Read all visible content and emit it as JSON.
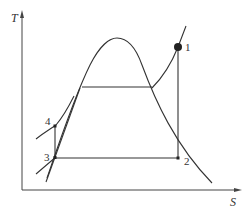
{
  "diagram": {
    "type": "T-S diagram (vapor compression / Rankine cycle)",
    "axes": {
      "y_label": "T",
      "x_label": "S"
    },
    "points": [
      {
        "id": "1",
        "label": "1"
      },
      {
        "id": "2",
        "label": "2"
      },
      {
        "id": "3",
        "label": "3"
      },
      {
        "id": "4",
        "label": "4"
      }
    ],
    "colors": {
      "line": "#333333",
      "background": "#ffffff"
    }
  }
}
